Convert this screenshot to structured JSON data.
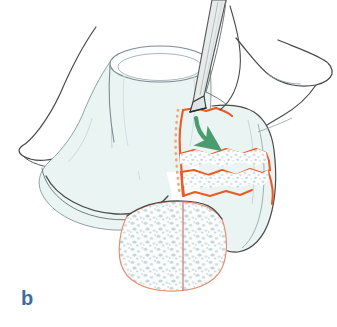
{
  "figure": {
    "panel_label": "b",
    "panel_label_color": "#3a6ea5",
    "background_color": "#ffffff"
  },
  "palette": {
    "bone_outline": "#4a4a4a",
    "bone_outline_light": "#9aa8ad",
    "bone_fill": "#eaf4f3",
    "bone_fill_shadow": "#dceceb",
    "osteotomy_orange": "#ea5a24",
    "osteotomy_orange_light": "#f2a07a",
    "osteotomy_dotted": "#f0a878",
    "arrow_green": "#4a9b6e",
    "instrument_fill": "#e7eceb",
    "instrument_outline": "#55595b",
    "instrument_tip": "#2b2b2b",
    "cancellous_speckle": "#c9d6d8",
    "cancellous_fill": "#fbfcfc",
    "cut_line_salmon": "#d98b7a",
    "panel_label_blue": "#3a6ea5"
  },
  "elements": {
    "femur_shaft": "femoral shaft cylinder",
    "lateral_condyle": "lateral femoral condyle",
    "medial_condyle": "medial femoral condyle",
    "patella_outline": "patellar / soft-tissue outline",
    "osteotomy_wedge": "orange marked closing wedge",
    "dotted_guide_line": "dotted orange planned cut guide",
    "cancellous_cross_section": "speckled cancellous bone cut surface",
    "osteotome": "osteotome / chisel instrument",
    "rotation_arrow": "green curved rotation arrow"
  },
  "annotations": {
    "arrow_direction": "clockwise rotation of wedge fragment",
    "instrument_name": "osteotome",
    "wedge_type": "closing wedge osteotomy"
  }
}
